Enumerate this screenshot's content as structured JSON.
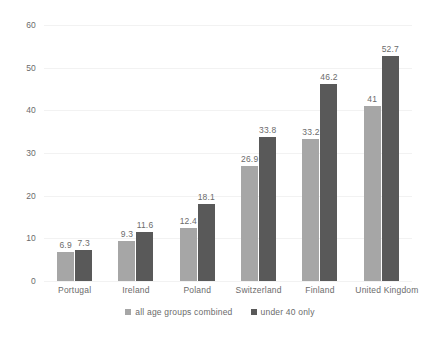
{
  "chart_data": {
    "type": "bar",
    "title": "",
    "subtitle": "",
    "xlabel": "",
    "ylabel": "",
    "ylim": [
      0,
      60
    ],
    "ytick_labels": [
      "0",
      "10",
      "20",
      "30",
      "40",
      "50",
      "60"
    ],
    "ytick_values": [
      0,
      10,
      20,
      30,
      40,
      50,
      60
    ],
    "grid": "horizontal",
    "legend_position": "bottom-center",
    "categories": [
      "Portugal",
      "Ireland",
      "Poland",
      "Switzerland",
      "Finland",
      "United Kingdom"
    ],
    "series": [
      {
        "name": "all age groups combined",
        "color": "#a6a6a6",
        "values": [
          6.9,
          9.3,
          12.4,
          26.9,
          33.2,
          41
        ],
        "labels": [
          "6.9",
          "9.3",
          "12.4",
          "26.9",
          "33.2",
          "41"
        ]
      },
      {
        "name": "under 40 only",
        "color": "#595959",
        "values": [
          7.3,
          11.6,
          18.1,
          33.8,
          46.2,
          52.7
        ],
        "labels": [
          "7.3",
          "11.6",
          "18.1",
          "33.8",
          "46.2",
          "52.7"
        ]
      }
    ]
  },
  "colors": {
    "background": "#ffffff",
    "gridline": "#f2f2f2",
    "text": "#6b6b6b",
    "series_1": "#a6a6a6",
    "series_2": "#595959"
  }
}
